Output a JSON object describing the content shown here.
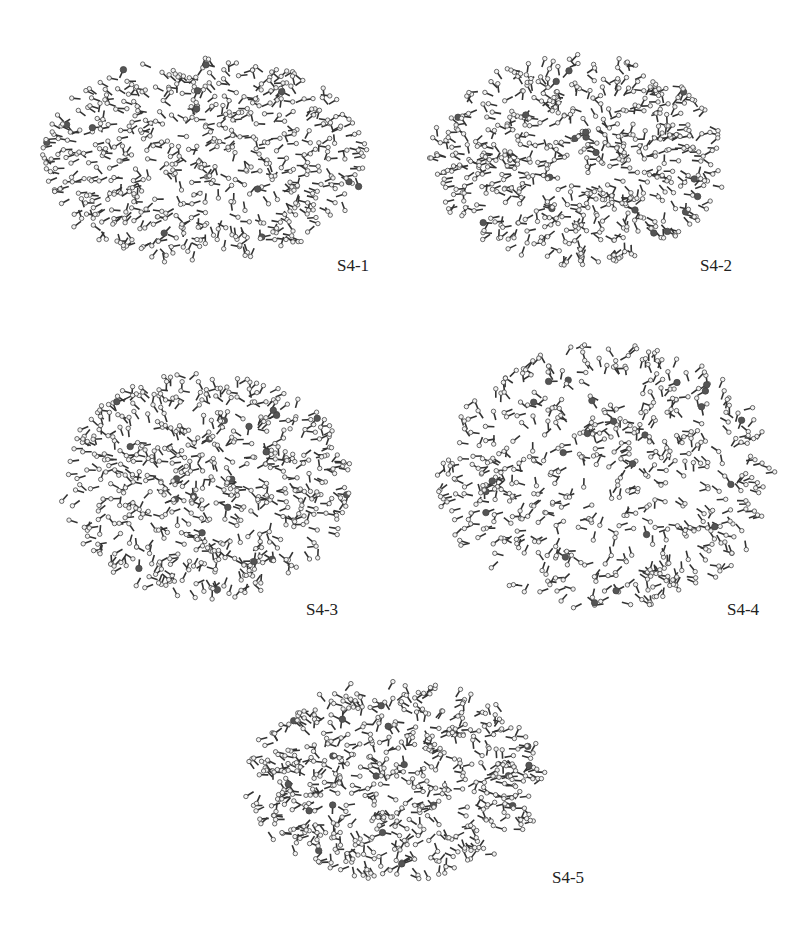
{
  "figure": {
    "panels": [
      {
        "id": "S4-1",
        "label": "S4-1",
        "box": [
          22,
          40,
          360,
          240
        ],
        "label_pos": [
          337,
          256
        ],
        "seed": 11
      },
      {
        "id": "S4-2",
        "label": "S4-2",
        "box": [
          415,
          40,
          325,
          240
        ],
        "label_pos": [
          700,
          256
        ],
        "seed": 23
      },
      {
        "id": "S4-3",
        "label": "S4-3",
        "box": [
          45,
          355,
          320,
          260
        ],
        "label_pos": [
          306,
          600
        ],
        "seed": 37
      },
      {
        "id": "S4-4",
        "label": "S4-4",
        "box": [
          420,
          320,
          370,
          310
        ],
        "label_pos": [
          727,
          600
        ],
        "seed": 41
      },
      {
        "id": "S4-5",
        "label": "S4-5",
        "box": [
          230,
          665,
          330,
          230
        ],
        "label_pos": [
          552,
          868
        ],
        "seed": 53
      }
    ],
    "colors": {
      "bond": "#333333",
      "atom": "#f2f2f2",
      "hetero": "#555555"
    }
  }
}
